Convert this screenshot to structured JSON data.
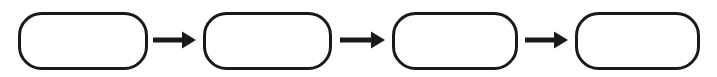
{
  "diagram": {
    "type": "process-flow",
    "title": "",
    "orientation": "horizontal",
    "canvas": {
      "width": 717,
      "height": 77,
      "background": "#ffffff"
    },
    "style": {
      "node_shape": "rounded-rectangle",
      "node_fill": "#ffffff",
      "node_stroke": "#1a1a1a",
      "node_stroke_width": 3,
      "node_corner_radius": 22,
      "connector_color": "#1a1a1a",
      "connector_shaft_thickness": 5,
      "connector_head_width": 14,
      "connector_head_height": 17
    },
    "nodes": [
      {
        "id": "node-1",
        "label": "",
        "x": 18,
        "y": 12,
        "width": 130,
        "height": 58
      },
      {
        "id": "node-2",
        "label": "",
        "x": 203,
        "y": 12,
        "width": 129,
        "height": 58
      },
      {
        "id": "node-3",
        "label": "",
        "x": 392,
        "y": 12,
        "width": 126,
        "height": 58
      },
      {
        "id": "node-4",
        "label": "",
        "x": 575,
        "y": 12,
        "width": 125,
        "height": 58
      }
    ],
    "connectors": [
      {
        "id": "arrow-1",
        "from": "node-1",
        "to": "node-2",
        "label": "",
        "direction": "right",
        "x_start": 153,
        "x_end": 196,
        "y": 40
      },
      {
        "id": "arrow-2",
        "from": "node-2",
        "to": "node-3",
        "label": "",
        "direction": "right",
        "x_start": 340,
        "x_end": 385,
        "y": 40
      },
      {
        "id": "arrow-3",
        "from": "node-3",
        "to": "node-4",
        "label": "",
        "direction": "right",
        "x_start": 525,
        "x_end": 568,
        "y": 40
      }
    ]
  }
}
